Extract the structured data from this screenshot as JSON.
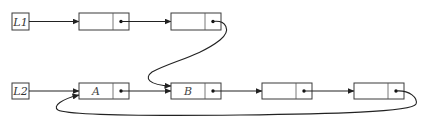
{
  "diagram": {
    "type": "linked-list-diagram",
    "lists": [
      {
        "head_label": "L1",
        "nodes": [
          {
            "value": ""
          },
          {
            "value": ""
          }
        ]
      },
      {
        "head_label": "L2",
        "nodes": [
          {
            "value": "A"
          },
          {
            "value": "B"
          },
          {
            "value": ""
          },
          {
            "value": ""
          }
        ]
      }
    ],
    "links": [
      {
        "from": "L1",
        "to": "L1 node 1"
      },
      {
        "from": "L1 node 1",
        "to": "L1 node 2"
      },
      {
        "from": "L1 node 2",
        "to": "L2 node B",
        "style": "curved"
      },
      {
        "from": "L2",
        "to": "L2 node A"
      },
      {
        "from": "L2 node A",
        "to": "L2 node B"
      },
      {
        "from": "L2 node B",
        "to": "L2 node 3"
      },
      {
        "from": "L2 node 3",
        "to": "L2 node 4"
      },
      {
        "from": "L2 node 4",
        "to": "L2 node A",
        "style": "curved-loop"
      }
    ],
    "colors": {
      "stroke": "#222222",
      "background": "#ffffff"
    }
  }
}
